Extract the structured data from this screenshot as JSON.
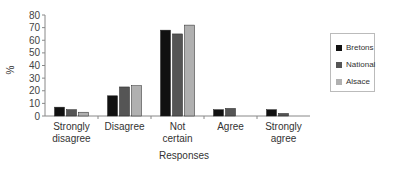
{
  "chart_data": {
    "type": "bar",
    "title": "",
    "xlabel": "Responses",
    "ylabel": "%",
    "ylim": [
      0,
      80
    ],
    "yticks": [
      0,
      10,
      20,
      30,
      40,
      50,
      60,
      70,
      80
    ],
    "grid": false,
    "legend_position": "right",
    "categories": [
      [
        "Strongly",
        "disagree"
      ],
      [
        "Disagree"
      ],
      [
        "Not",
        "certain"
      ],
      [
        "Agree"
      ],
      [
        "Strongly",
        "agree"
      ]
    ],
    "series": [
      {
        "name": "Bretons",
        "color": "#111111",
        "values": [
          7,
          16,
          68,
          5,
          5
        ]
      },
      {
        "name": "National",
        "color": "#555555",
        "values": [
          5,
          23,
          65,
          6,
          2
        ]
      },
      {
        "name": "Alsace",
        "color": "#b0b0b0",
        "values": [
          3,
          24,
          72,
          0,
          0
        ]
      }
    ]
  },
  "legend": {
    "items": [
      {
        "label": "Bretons",
        "color": "#111111"
      },
      {
        "label": "National",
        "color": "#555555"
      },
      {
        "label": "Alsace",
        "color": "#b0b0b0"
      }
    ]
  }
}
